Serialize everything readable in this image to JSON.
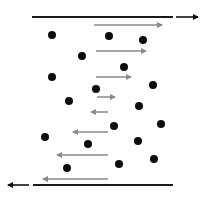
{
  "diagram": {
    "type": "shear-flow-between-plates",
    "width": 211,
    "height": 198,
    "colors": {
      "plate": "#1a1a1a",
      "plate_arrow": "#111111",
      "velocity_arrow": "#8a8a8a",
      "particle": "#0d0d0d",
      "background": "#ffffff"
    },
    "top_plate": {
      "x1": 32,
      "x2": 173,
      "y": 17
    },
    "top_plate_arrow": {
      "x1": 176,
      "x2": 198,
      "y": 17,
      "direction": "right"
    },
    "bottom_plate": {
      "x1": 33,
      "x2": 173,
      "y": 185
    },
    "bottom_plate_arrow": {
      "x1": 29,
      "x2": 8,
      "y": 185,
      "direction": "left"
    },
    "velocity_arrows": [
      {
        "x1": 94,
        "x2": 162,
        "y": 25,
        "direction": "right"
      },
      {
        "x1": 96,
        "x2": 146,
        "y": 51,
        "direction": "right"
      },
      {
        "x1": 96,
        "x2": 131,
        "y": 77,
        "direction": "right"
      },
      {
        "x1": 97,
        "x2": 115,
        "y": 97,
        "direction": "right"
      },
      {
        "x1": 108,
        "x2": 91,
        "y": 112,
        "direction": "left"
      },
      {
        "x1": 108,
        "x2": 73,
        "y": 132,
        "direction": "left"
      },
      {
        "x1": 108,
        "x2": 57,
        "y": 155,
        "direction": "left"
      },
      {
        "x1": 108,
        "x2": 43,
        "y": 179,
        "direction": "left"
      }
    ],
    "particles": [
      {
        "cx": 52,
        "cy": 35
      },
      {
        "cx": 109,
        "cy": 36
      },
      {
        "cx": 143,
        "cy": 40
      },
      {
        "cx": 82,
        "cy": 56
      },
      {
        "cx": 124,
        "cy": 67
      },
      {
        "cx": 52,
        "cy": 77
      },
      {
        "cx": 153,
        "cy": 85
      },
      {
        "cx": 96,
        "cy": 89
      },
      {
        "cx": 69,
        "cy": 101
      },
      {
        "cx": 139,
        "cy": 106
      },
      {
        "cx": 114,
        "cy": 126
      },
      {
        "cx": 161,
        "cy": 124
      },
      {
        "cx": 45,
        "cy": 137
      },
      {
        "cx": 138,
        "cy": 141
      },
      {
        "cx": 88,
        "cy": 144
      },
      {
        "cx": 154,
        "cy": 159
      },
      {
        "cx": 119,
        "cy": 164
      },
      {
        "cx": 67,
        "cy": 168
      }
    ]
  }
}
